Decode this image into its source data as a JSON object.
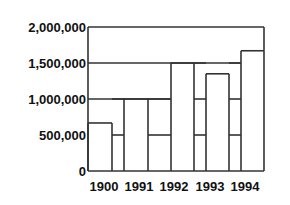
{
  "chart_data": {
    "type": "bar",
    "title": "",
    "xlabel": "",
    "ylabel": "",
    "ylim": [
      0,
      2000000
    ],
    "grid": false,
    "legend": null,
    "categories": [
      "1900",
      "1991",
      "1992",
      "1993",
      "1994"
    ],
    "y_ticks": [
      "0",
      "500,000",
      "1,000,000",
      "1,500,000",
      "2,000,000"
    ],
    "y_tick_values": [
      0,
      500000,
      1000000,
      1500000,
      2000000
    ],
    "series": [
      {
        "name": "bars",
        "values": [
          667000,
          1000000,
          1500000,
          1350000,
          1670000
        ]
      }
    ],
    "reference_lines": [
      {
        "segment": "gap after 1900",
        "levels": [
          500000,
          1000000
        ]
      },
      {
        "segment": "gap after 1991",
        "levels": [
          500000,
          1000000
        ]
      },
      {
        "segment": "gap after 1992",
        "levels": [
          500000,
          1000000,
          1500000
        ]
      },
      {
        "segment": "gap after 1993",
        "levels": [
          500000,
          1000000,
          1500000
        ]
      }
    ]
  }
}
